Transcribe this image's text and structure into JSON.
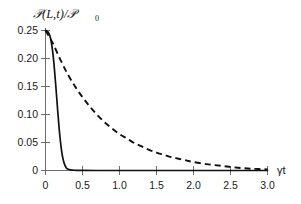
{
  "chart_data": {
    "type": "line",
    "title": "",
    "xlabel": "γt",
    "ylabel": "𝒫(L,t)/𝒫₀",
    "ylabel_main": "𝒫(L,t)/𝒫",
    "ylabel_subscript": "0",
    "xlim": [
      0,
      3.0
    ],
    "ylim": [
      0,
      0.25
    ],
    "grid": false,
    "legend": "none",
    "xticks": [
      0,
      0.5,
      1.0,
      1.5,
      2.0,
      2.5,
      3.0
    ],
    "xtick_labels": [
      "0",
      "0.5",
      "1.0",
      "1.5",
      "2.0",
      "2.5",
      "3.0"
    ],
    "yticks": [
      0,
      0.05,
      0.1,
      0.15,
      0.2,
      0.25
    ],
    "ytick_labels": [
      "0",
      "0.05",
      "0.10",
      "0.15",
      "0.20",
      "0.25"
    ],
    "series": [
      {
        "name": "solid-curve",
        "style": "solid",
        "color": "#111111",
        "x": [
          0.0,
          0.02,
          0.04,
          0.06,
          0.08,
          0.1,
          0.12,
          0.14,
          0.16,
          0.18,
          0.2,
          0.22,
          0.24,
          0.26,
          0.28,
          0.3,
          0.34,
          0.4,
          0.5,
          0.7,
          1.0,
          1.5,
          2.0,
          2.5,
          3.0
        ],
        "y": [
          0.25,
          0.249,
          0.246,
          0.24,
          0.228,
          0.209,
          0.182,
          0.15,
          0.115,
          0.082,
          0.054,
          0.033,
          0.019,
          0.01,
          0.005,
          0.0025,
          0.001,
          0.0004,
          0.0001,
          0.0,
          0.0,
          0.0,
          0.0,
          0.0,
          0.0
        ]
      },
      {
        "name": "dashed-curve",
        "style": "dashed",
        "color": "#111111",
        "x": [
          0.0,
          0.1,
          0.2,
          0.3,
          0.4,
          0.5,
          0.6,
          0.7,
          0.8,
          0.9,
          1.0,
          1.1,
          1.2,
          1.3,
          1.4,
          1.5,
          1.6,
          1.7,
          1.8,
          1.9,
          2.0,
          2.2,
          2.4,
          2.6,
          2.8,
          3.0
        ],
        "y": [
          0.25,
          0.227,
          0.198,
          0.172,
          0.15,
          0.131,
          0.114,
          0.099,
          0.086,
          0.075,
          0.065,
          0.057,
          0.049,
          0.043,
          0.037,
          0.032,
          0.028,
          0.024,
          0.021,
          0.018,
          0.015,
          0.011,
          0.008,
          0.005,
          0.003,
          0.002
        ]
      }
    ]
  }
}
